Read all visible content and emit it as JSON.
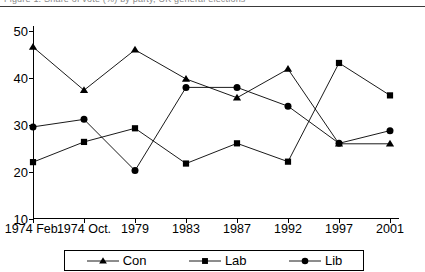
{
  "caption": {
    "text": "Figure 1. Share of vote (%) by party, UK general elections"
  },
  "chart_data": {
    "type": "line",
    "title": "",
    "subtitle": "",
    "xlabel": "",
    "ylabel": "",
    "categories": [
      "1974 Feb.",
      "1974 Oct.",
      "1979",
      "1983",
      "1987",
      "1992",
      "1997",
      "2001"
    ],
    "series": [
      {
        "name": "Con",
        "marker": "triangle",
        "color": "#000000",
        "values": [
          46.6,
          37.4,
          46.0,
          39.8,
          35.8,
          41.9,
          26.0,
          26.0
        ]
      },
      {
        "name": "Lab",
        "marker": "square",
        "color": "#000000",
        "values": [
          22.1,
          26.4,
          29.3,
          21.8,
          26.1,
          22.2,
          43.2,
          36.3
        ]
      },
      {
        "name": "Lib",
        "marker": "circle",
        "color": "#000000",
        "values": [
          29.6,
          31.2,
          20.3,
          38.0,
          38.0,
          34.0,
          26.1,
          28.8
        ]
      }
    ],
    "ylim": [
      10,
      50
    ],
    "yticks": [
      10,
      20,
      30,
      40,
      50
    ],
    "ytick_labels": [
      "10",
      "20",
      "30",
      "40",
      "50"
    ],
    "grid": false,
    "legend_position": "bottom",
    "legend_entries": [
      "Con",
      "Lab",
      "Lib"
    ]
  },
  "legend": {
    "items": [
      {
        "label": "Con",
        "marker": "triangle"
      },
      {
        "label": "Lab",
        "marker": "square"
      },
      {
        "label": "Lib",
        "marker": "circle"
      }
    ]
  },
  "colors": {
    "line": "#000000",
    "axis": "#000000",
    "rule": "#3a3a3a",
    "background": "#ffffff"
  }
}
